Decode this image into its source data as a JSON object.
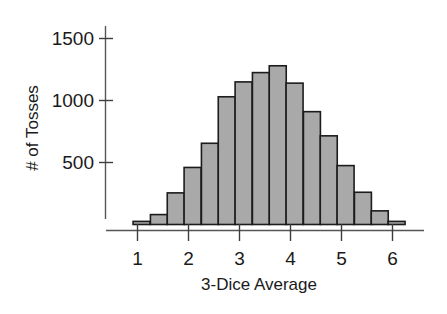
{
  "chart_data": {
    "type": "bar",
    "title": "",
    "subtitle": "",
    "xlabel": "3-Dice Average",
    "ylabel": "# of Tosses",
    "grid": false,
    "legend": "none",
    "xlim": [
      0.75,
      6.45
    ],
    "ylim": [
      0,
      1600
    ],
    "bar_width": 0.333,
    "x_tick_labels": [
      "1",
      "2",
      "3",
      "4",
      "5",
      "6"
    ],
    "x_tick_values": [
      1,
      2,
      3,
      4,
      5,
      6
    ],
    "y_tick_labels": [
      "500",
      "1000",
      "1500"
    ],
    "y_tick_values": [
      500,
      1000,
      1500
    ],
    "bin_centers": [
      1.08,
      1.42,
      1.75,
      2.08,
      2.42,
      2.75,
      3.08,
      3.42,
      3.75,
      4.08,
      4.42,
      4.75,
      5.08,
      5.42,
      5.75,
      6.08
    ],
    "categories": [
      "1.08",
      "1.42",
      "1.75",
      "2.08",
      "2.42",
      "2.75",
      "3.08",
      "3.42",
      "3.75",
      "4.08",
      "4.42",
      "4.75",
      "5.08",
      "5.42",
      "5.75",
      "6.08"
    ],
    "values": [
      25,
      80,
      255,
      460,
      655,
      1030,
      1150,
      1225,
      1280,
      1140,
      910,
      715,
      475,
      260,
      110,
      25
    ],
    "colors": {
      "bar_fill": "#a9a9a9",
      "bar_edge": "#1c1c1c",
      "axis": "#555555",
      "text": "#1a1a1a",
      "background": "#ffffff"
    }
  },
  "axes": {
    "y_axis_label": "# of Tosses",
    "x_axis_label": "3-Dice Average"
  },
  "y_ticks": [
    {
      "label": "1500",
      "value": 1500
    },
    {
      "label": "1000",
      "value": 1000
    },
    {
      "label": "500",
      "value": 500
    }
  ],
  "x_ticks": [
    {
      "label": "1",
      "value": 1
    },
    {
      "label": "2",
      "value": 2
    },
    {
      "label": "3",
      "value": 3
    },
    {
      "label": "4",
      "value": 4
    },
    {
      "label": "5",
      "value": 5
    },
    {
      "label": "6",
      "value": 6
    }
  ]
}
